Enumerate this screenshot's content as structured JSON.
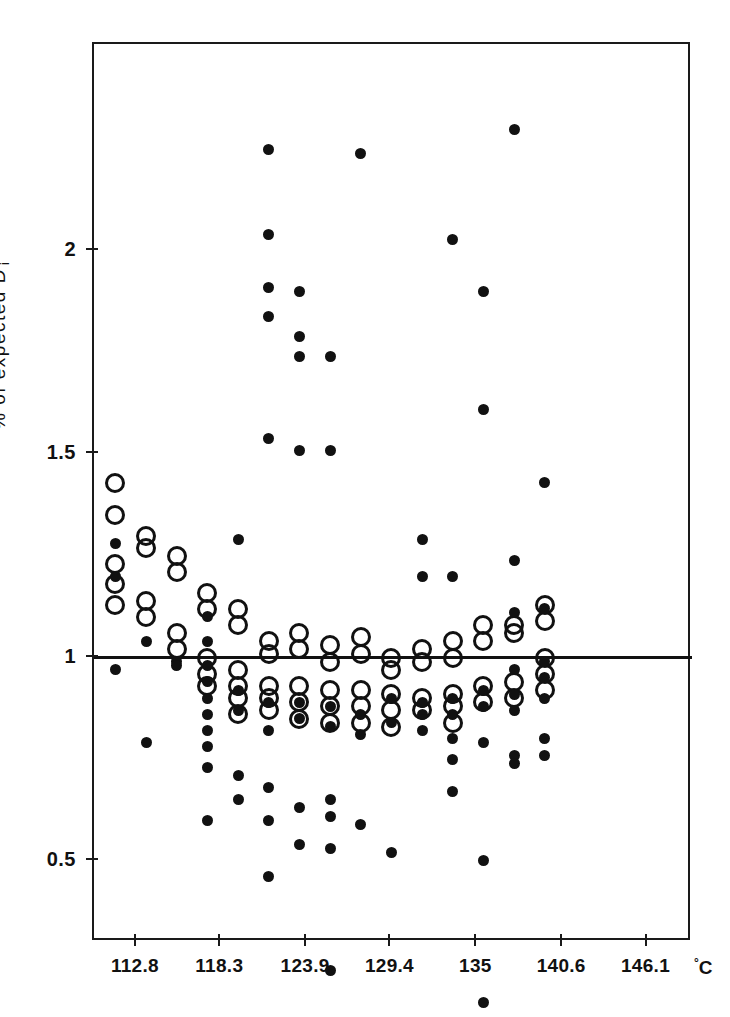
{
  "chart_data": {
    "type": "scatter",
    "title": "",
    "xlabel": "°C",
    "ylabel": "% of expected D i",
    "ylabel_text": "% of expected D",
    "ylabel_sub": "i",
    "x_unit": "C",
    "x_unit_sup": "°",
    "xlim": [
      110.0,
      149.0
    ],
    "ylim": [
      0.3,
      2.51
    ],
    "yticks": [
      0,
      0.5,
      1,
      1.5,
      2
    ],
    "ytick_labels": [
      "0",
      "0.5",
      "1",
      "1.5",
      "2"
    ],
    "xticks": [
      112.8,
      118.3,
      123.9,
      129.4,
      135,
      140.6,
      146.1
    ],
    "xtick_labels": [
      "112.8",
      "118.3",
      "123.9",
      "129.4",
      "135",
      "140.6",
      "146.1"
    ],
    "grid": false,
    "legend": null,
    "reference_line": {
      "y": 1,
      "orientation": "horizontal",
      "color": "#111111"
    },
    "marker_styles": {
      "open_circle": {
        "name": "open-circle",
        "size_px": 20,
        "fill": "none",
        "stroke": "#111111"
      },
      "filled_dot": {
        "name": "filled-dot",
        "size_px": 11,
        "fill": "#111111",
        "stroke": "none"
      }
    },
    "series": [
      {
        "name": "open circles",
        "marker": "open_circle",
        "points": [
          [
            111.4,
            1.43
          ],
          [
            111.4,
            1.35
          ],
          [
            111.4,
            1.23
          ],
          [
            111.4,
            1.18
          ],
          [
            111.4,
            1.13
          ],
          [
            113.4,
            1.3
          ],
          [
            113.4,
            1.27
          ],
          [
            113.4,
            1.14
          ],
          [
            113.4,
            1.1
          ],
          [
            115.4,
            1.25
          ],
          [
            115.4,
            1.21
          ],
          [
            115.4,
            1.06
          ],
          [
            115.4,
            1.02
          ],
          [
            117.4,
            1.16
          ],
          [
            117.4,
            1.12
          ],
          [
            117.4,
            1.0
          ],
          [
            117.4,
            0.96
          ],
          [
            117.4,
            0.93
          ],
          [
            119.4,
            1.12
          ],
          [
            119.4,
            1.08
          ],
          [
            119.4,
            0.97
          ],
          [
            119.4,
            0.93
          ],
          [
            119.4,
            0.9
          ],
          [
            119.4,
            0.86
          ],
          [
            121.4,
            1.04
          ],
          [
            121.4,
            1.01
          ],
          [
            121.4,
            0.93
          ],
          [
            121.4,
            0.9
          ],
          [
            121.4,
            0.87
          ],
          [
            123.4,
            1.06
          ],
          [
            123.4,
            1.02
          ],
          [
            123.4,
            0.93
          ],
          [
            123.4,
            0.89
          ],
          [
            123.4,
            0.85
          ],
          [
            125.4,
            1.03
          ],
          [
            125.4,
            0.99
          ],
          [
            125.4,
            0.92
          ],
          [
            125.4,
            0.88
          ],
          [
            125.4,
            0.84
          ],
          [
            127.4,
            1.05
          ],
          [
            127.4,
            1.01
          ],
          [
            127.4,
            0.92
          ],
          [
            127.4,
            0.88
          ],
          [
            127.4,
            0.84
          ],
          [
            129.4,
            1.0
          ],
          [
            129.4,
            0.97
          ],
          [
            129.4,
            0.91
          ],
          [
            129.4,
            0.87
          ],
          [
            129.4,
            0.83
          ],
          [
            131.4,
            1.02
          ],
          [
            131.4,
            0.99
          ],
          [
            131.4,
            0.9
          ],
          [
            131.4,
            0.87
          ],
          [
            133.4,
            1.04
          ],
          [
            133.4,
            1.0
          ],
          [
            133.4,
            0.91
          ],
          [
            133.4,
            0.88
          ],
          [
            133.4,
            0.84
          ],
          [
            135.4,
            1.08
          ],
          [
            135.4,
            1.04
          ],
          [
            135.4,
            0.93
          ],
          [
            135.4,
            0.89
          ],
          [
            137.4,
            1.08
          ],
          [
            137.4,
            1.06
          ],
          [
            137.4,
            0.94
          ],
          [
            137.4,
            0.9
          ],
          [
            139.4,
            1.13
          ],
          [
            139.4,
            1.09
          ],
          [
            139.4,
            1.0
          ],
          [
            139.4,
            0.96
          ],
          [
            139.4,
            0.92
          ]
        ]
      },
      {
        "name": "filled dots",
        "marker": "filled_dot",
        "points": [
          [
            111.4,
            1.28
          ],
          [
            111.4,
            1.2
          ],
          [
            111.4,
            0.97
          ],
          [
            113.4,
            1.04
          ],
          [
            113.4,
            0.79
          ],
          [
            115.4,
            0.99
          ],
          [
            115.4,
            0.98
          ],
          [
            117.4,
            1.1
          ],
          [
            117.4,
            1.04
          ],
          [
            117.4,
            0.98
          ],
          [
            117.4,
            0.94
          ],
          [
            117.4,
            0.9
          ],
          [
            117.4,
            0.86
          ],
          [
            117.4,
            0.82
          ],
          [
            117.4,
            0.78
          ],
          [
            117.4,
            0.73
          ],
          [
            117.4,
            0.6
          ],
          [
            119.4,
            1.29
          ],
          [
            119.4,
            0.92
          ],
          [
            119.4,
            0.87
          ],
          [
            119.4,
            0.71
          ],
          [
            119.4,
            0.65
          ],
          [
            121.4,
            2.25
          ],
          [
            121.4,
            2.04
          ],
          [
            121.4,
            1.91
          ],
          [
            121.4,
            1.84
          ],
          [
            121.4,
            1.54
          ],
          [
            121.4,
            0.89
          ],
          [
            121.4,
            0.82
          ],
          [
            121.4,
            0.68
          ],
          [
            121.4,
            0.6
          ],
          [
            121.4,
            0.46
          ],
          [
            123.4,
            1.9
          ],
          [
            123.4,
            1.79
          ],
          [
            123.4,
            1.74
          ],
          [
            123.4,
            1.51
          ],
          [
            123.4,
            0.89
          ],
          [
            123.4,
            0.85
          ],
          [
            123.4,
            0.63
          ],
          [
            123.4,
            0.54
          ],
          [
            125.4,
            1.74
          ],
          [
            125.4,
            1.51
          ],
          [
            125.4,
            0.88
          ],
          [
            125.4,
            0.83
          ],
          [
            125.4,
            0.65
          ],
          [
            125.4,
            0.61
          ],
          [
            125.4,
            0.53
          ],
          [
            125.4,
            0.23
          ],
          [
            127.4,
            2.24
          ],
          [
            127.4,
            0.86
          ],
          [
            127.4,
            0.81
          ],
          [
            127.4,
            0.59
          ],
          [
            129.4,
            0.9
          ],
          [
            129.4,
            0.84
          ],
          [
            129.4,
            0.52
          ],
          [
            131.4,
            1.29
          ],
          [
            131.4,
            1.2
          ],
          [
            131.4,
            0.89
          ],
          [
            131.4,
            0.86
          ],
          [
            131.4,
            0.82
          ],
          [
            133.4,
            2.03
          ],
          [
            133.4,
            1.2
          ],
          [
            133.4,
            0.9
          ],
          [
            133.4,
            0.86
          ],
          [
            133.4,
            0.8
          ],
          [
            133.4,
            0.75
          ],
          [
            133.4,
            0.67
          ],
          [
            135.4,
            1.9
          ],
          [
            135.4,
            1.61
          ],
          [
            135.4,
            0.92
          ],
          [
            135.4,
            0.88
          ],
          [
            135.4,
            0.79
          ],
          [
            135.4,
            0.5
          ],
          [
            135.4,
            0.15
          ],
          [
            137.4,
            2.3
          ],
          [
            137.4,
            1.24
          ],
          [
            137.4,
            1.11
          ],
          [
            137.4,
            0.97
          ],
          [
            137.4,
            0.91
          ],
          [
            137.4,
            0.87
          ],
          [
            137.4,
            0.76
          ],
          [
            137.4,
            0.74
          ],
          [
            139.4,
            1.43
          ],
          [
            139.4,
            1.12
          ],
          [
            139.4,
            0.99
          ],
          [
            139.4,
            0.95
          ],
          [
            139.4,
            0.9
          ],
          [
            139.4,
            0.8
          ],
          [
            139.4,
            0.76
          ]
        ]
      }
    ]
  }
}
